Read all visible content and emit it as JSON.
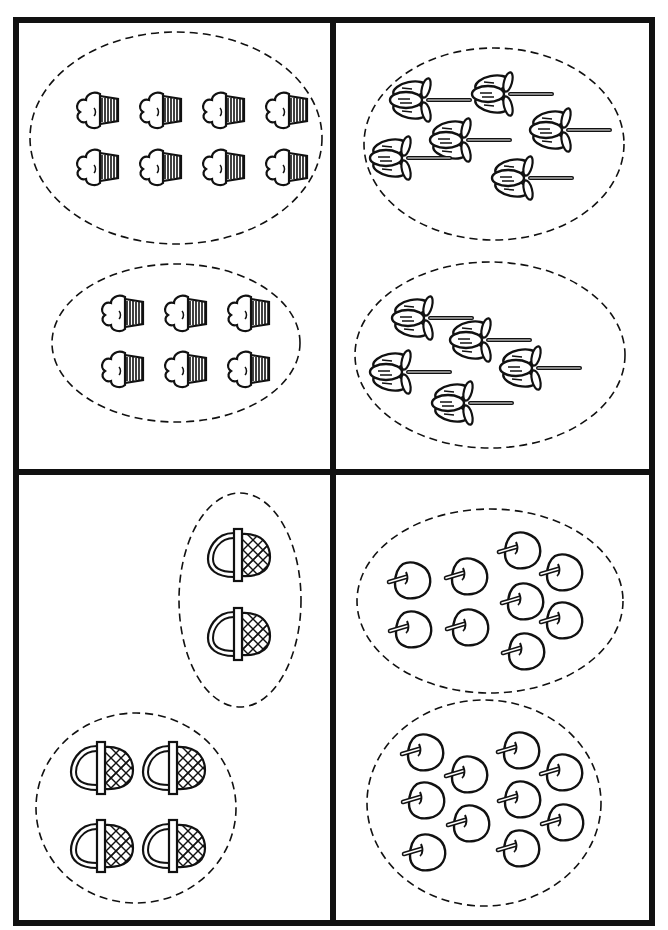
{
  "worksheet": {
    "quadrants": [
      {
        "id": "top-left",
        "object": "cupcake",
        "groups": [
          {
            "label": "cupcakes group 1",
            "count": 8,
            "ellipse": {
              "cx": 176,
              "cy": 138,
              "rx": 146,
              "ry": 106
            },
            "items": [
              [
                92,
                110
              ],
              [
                155,
                110
              ],
              [
                218,
                110
              ],
              [
                281,
                110
              ],
              [
                92,
                167
              ],
              [
                155,
                167
              ],
              [
                218,
                167
              ],
              [
                281,
                167
              ]
            ]
          },
          {
            "label": "cupcakes group 2",
            "count": 6,
            "ellipse": {
              "cx": 176,
              "cy": 343,
              "rx": 124,
              "ry": 79
            },
            "items": [
              [
                117,
                313
              ],
              [
                180,
                313
              ],
              [
                243,
                313
              ],
              [
                117,
                369
              ],
              [
                180,
                369
              ],
              [
                243,
                369
              ]
            ]
          }
        ]
      },
      {
        "id": "top-right",
        "object": "flower",
        "groups": [
          {
            "label": "flowers group 1",
            "count": 6,
            "ellipse": {
              "cx": 494,
              "cy": 144,
              "rx": 130,
              "ry": 96
            },
            "items": [
              [
                418,
                100
              ],
              [
                500,
                94
              ],
              [
                458,
                140
              ],
              [
                558,
                130
              ],
              [
                398,
                158
              ],
              [
                520,
                178
              ],
              [
                450,
                192
              ]
            ]
          },
          {
            "label": "flowers group 2",
            "count": 5,
            "ellipse": {
              "cx": 490,
              "cy": 355,
              "rx": 135,
              "ry": 93
            },
            "items": [
              [
                420,
                318
              ],
              [
                478,
                340
              ],
              [
                398,
                372
              ],
              [
                528,
                368
              ],
              [
                460,
                403
              ]
            ]
          }
        ]
      },
      {
        "id": "bottom-left",
        "object": "basket",
        "groups": [
          {
            "label": "baskets group 1",
            "count": 2,
            "ellipse": {
              "cx": 240,
              "cy": 600,
              "rx": 61,
              "ry": 107
            },
            "items": [
              [
                238,
                555
              ],
              [
                238,
                634
              ]
            ]
          },
          {
            "label": "baskets group 2",
            "count": 4,
            "ellipse": {
              "cx": 136,
              "cy": 808,
              "rx": 100,
              "ry": 95
            },
            "items": [
              [
                101,
                768
              ],
              [
                173,
                768
              ],
              [
                101,
                846
              ],
              [
                173,
                846
              ]
            ]
          }
        ]
      },
      {
        "id": "bottom-right",
        "object": "apple",
        "groups": [
          {
            "label": "apples group 1",
            "count": 9,
            "ellipse": {
              "cx": 490,
              "cy": 601,
              "rx": 133,
              "ry": 92
            },
            "items": [
              [
                411,
                580
              ],
              [
                468,
                576
              ],
              [
                521,
                550
              ],
              [
                563,
                572
              ],
              [
                412,
                629
              ],
              [
                469,
                627
              ],
              [
                524,
                601
              ],
              [
                563,
                620
              ],
              [
                525,
                651
              ]
            ]
          },
          {
            "label": "apples group 2",
            "count": 10,
            "ellipse": {
              "cx": 484,
              "cy": 803,
              "rx": 117,
              "ry": 103
            },
            "items": [
              [
                424,
                752
              ],
              [
                468,
                774
              ],
              [
                520,
                750
              ],
              [
                563,
                772
              ],
              [
                425,
                800
              ],
              [
                470,
                823
              ],
              [
                521,
                799
              ],
              [
                564,
                822
              ],
              [
                426,
                852
              ],
              [
                520,
                848
              ]
            ]
          }
        ]
      }
    ]
  },
  "colors": {
    "ink": "#111111",
    "paper": "#ffffff"
  }
}
